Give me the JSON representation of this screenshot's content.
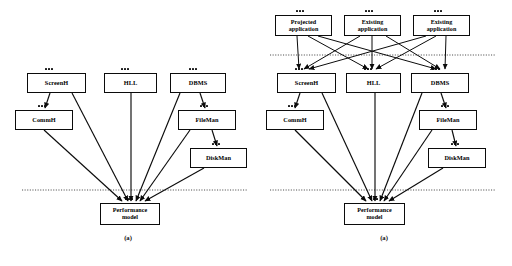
{
  "figure": {
    "type": "two-panel-layered-architecture-diagram",
    "background_color": "#ffffff",
    "line_color": "#0b0b0b",
    "dashed_line_color": "#3a3a3a",
    "panels": [
      {
        "id": "panel-a",
        "caption": "(a)",
        "nodes": [
          {
            "id": "screenh-a",
            "label": "ScreenH",
            "x": 27,
            "y": 73,
            "w": 59,
            "h": 20,
            "ports": true
          },
          {
            "id": "hll-a",
            "label": "HLL",
            "x": 104,
            "y": 73,
            "w": 53,
            "h": 20,
            "ports": true
          },
          {
            "id": "dbms-a",
            "label": "DBMS",
            "x": 170,
            "y": 73,
            "w": 56,
            "h": 20,
            "ports": true
          },
          {
            "id": "commh-a",
            "label": "CommH",
            "x": 15,
            "y": 110,
            "w": 58,
            "h": 20,
            "ports": true
          },
          {
            "id": "fileman-a",
            "label": "FileMan",
            "x": 178,
            "y": 110,
            "w": 58,
            "h": 20,
            "ports": true
          },
          {
            "id": "diskman-a",
            "label": "DiskMan",
            "x": 190,
            "y": 148,
            "w": 57,
            "h": 20,
            "ports": true
          },
          {
            "id": "perf-model-a",
            "label": "Performance\nmodel",
            "x": 100,
            "y": 203,
            "w": 60,
            "h": 22,
            "ports": true
          }
        ],
        "dashed_separators": [
          {
            "y": 190
          }
        ]
      },
      {
        "id": "panel-b",
        "caption": "(a)",
        "nodes": [
          {
            "id": "projected-app",
            "label": "Projected\napplication",
            "x": 19,
            "y": 15,
            "w": 57,
            "h": 21,
            "ports": true
          },
          {
            "id": "existing-app-1",
            "label": "Existing\napplication",
            "x": 88,
            "y": 15,
            "w": 57,
            "h": 21,
            "ports": true
          },
          {
            "id": "existing-app-2",
            "label": "Existing\napplication",
            "x": 157,
            "y": 15,
            "w": 57,
            "h": 21,
            "ports": true
          },
          {
            "id": "screenh-b",
            "label": "ScreenH",
            "x": 21,
            "y": 73,
            "w": 59,
            "h": 20,
            "ports": true
          },
          {
            "id": "hll-b",
            "label": "HLL",
            "x": 90,
            "y": 73,
            "w": 55,
            "h": 20,
            "ports": true
          },
          {
            "id": "dbms-b",
            "label": "DBMS",
            "x": 155,
            "y": 73,
            "w": 58,
            "h": 20,
            "ports": true
          },
          {
            "id": "commh-b",
            "label": "CommH",
            "x": 10,
            "y": 110,
            "w": 58,
            "h": 20,
            "ports": true
          },
          {
            "id": "fileman-b",
            "label": "FileMan",
            "x": 163,
            "y": 110,
            "w": 58,
            "h": 20,
            "ports": true
          },
          {
            "id": "diskman-b",
            "label": "DiskMan",
            "x": 172,
            "y": 148,
            "w": 58,
            "h": 20,
            "ports": true
          },
          {
            "id": "perf-model-b",
            "label": "Performance\nmodel",
            "x": 88,
            "y": 203,
            "w": 61,
            "h": 22,
            "ports": true
          }
        ],
        "dashed_separators": [
          {
            "y": 55
          },
          {
            "y": 190
          }
        ]
      }
    ]
  }
}
